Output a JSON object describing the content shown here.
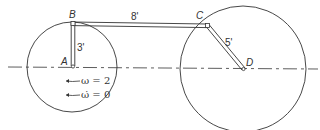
{
  "diagram": {
    "points": {
      "A": "A",
      "B": "B",
      "C": "C",
      "D": "D"
    },
    "links": {
      "AB_length": "3'",
      "BC_length": "8'",
      "CD_length": "5'"
    },
    "conditions": {
      "omega": "ω = 2",
      "omega_dot": "ω̇ = 0"
    },
    "colors": {
      "line": "#333333",
      "background": "#ffffff"
    }
  }
}
